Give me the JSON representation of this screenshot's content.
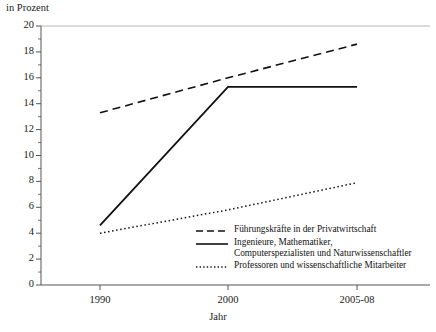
{
  "chart_data": {
    "type": "line",
    "title": "",
    "ylabel": "in Prozent",
    "xlabel": "Jahr",
    "categories": [
      "1990",
      "2000",
      "2005-08"
    ],
    "ylim": [
      0,
      20
    ],
    "yticks": [
      0,
      2,
      4,
      6,
      8,
      10,
      12,
      14,
      16,
      18,
      20
    ],
    "ytick_labels": [
      "0",
      "2",
      "4",
      "6",
      "8",
      "10",
      "12",
      "14",
      "16",
      "18",
      "20"
    ],
    "minor_ticks": true,
    "grid": false,
    "legend_position": "lower-right-inside",
    "series": [
      {
        "name": "Führungskräfte in der Privatwirtschaft",
        "style": "dashed",
        "color": "#111111",
        "values": [
          13.3,
          16.0,
          18.6
        ]
      },
      {
        "name": "Ingenieure, Mathematiker,\nComputerspezialisten und Naturwissenschaftler",
        "style": "solid",
        "color": "#111111",
        "values": [
          4.6,
          15.3,
          15.3
        ]
      },
      {
        "name": "Professoren und wissenschaftliche Mitarbeiter",
        "style": "dotted",
        "color": "#111111",
        "values": [
          4.0,
          5.8,
          7.9
        ]
      }
    ]
  },
  "legend": {
    "items": [
      {
        "label": "Führungskräfte in der Privatwirtschaft",
        "style": "dashed"
      },
      {
        "label": "Ingenieure, Mathematiker,\nComputerspezialisten und Naturwissenschaftler",
        "style": "solid"
      },
      {
        "label": "Professoren und wissenschaftliche Mitarbeiter",
        "style": "dotted"
      }
    ]
  },
  "axes": {
    "y_title": "in Prozent",
    "x_title": "Jahr",
    "y_labels": [
      "20",
      "18",
      "16",
      "14",
      "12",
      "10",
      "8",
      "6",
      "4",
      "2",
      "0"
    ],
    "x_labels": [
      "1990",
      "2000",
      "2005-08"
    ]
  }
}
